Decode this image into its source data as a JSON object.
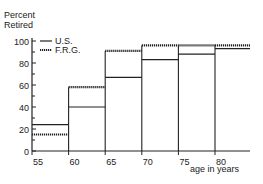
{
  "chart_data": {
    "type": "step",
    "title": "",
    "ylabel": "Percent Retired",
    "xlabel": "age in years",
    "ylim": [
      0,
      100
    ],
    "xlim": [
      55,
      85
    ],
    "yticks": [
      0,
      20,
      40,
      60,
      80,
      100
    ],
    "yticks_minor": [
      10,
      30,
      50,
      70,
      90
    ],
    "xticks": [
      55,
      60,
      65,
      70,
      75,
      80
    ],
    "grid": false,
    "legend_position": "upper-left",
    "bins": [
      "55-60",
      "60-65",
      "65-70",
      "70-75",
      "75-80",
      "80+"
    ],
    "bin_edges": [
      55,
      60,
      65,
      70,
      75,
      80,
      85
    ],
    "series": [
      {
        "name": "U.S.",
        "style": "solid",
        "values": [
          24,
          40,
          67,
          83,
          88,
          93
        ]
      },
      {
        "name": "F.R.G.",
        "style": "dashed",
        "values": [
          15,
          58,
          91,
          96,
          96,
          96
        ]
      }
    ]
  },
  "labels": {
    "ylabel_line1": "Percent",
    "ylabel_line2": "Retired",
    "xlabel": "age in years",
    "legend_us": "U.S.",
    "legend_frg": "F.R.G."
  }
}
